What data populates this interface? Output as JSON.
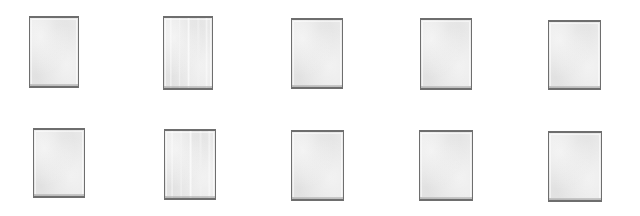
{
  "page": {
    "background_color": "#ffffff",
    "width": 640,
    "height": 216,
    "rows": 2,
    "columns": 5,
    "card_count": 10
  },
  "style": {
    "card_fill_color": "#e9e9e9",
    "card_border_color": "#6e6e6e",
    "card_border_width": 1,
    "card_top_bottom_border_width": 2
  },
  "cards": [
    {
      "id": "card-1",
      "row": 1,
      "column": 1,
      "label": "",
      "x": 29,
      "y": 16,
      "width": 50,
      "height": 72,
      "streaked": false
    },
    {
      "id": "card-2",
      "row": 1,
      "column": 2,
      "label": "",
      "x": 163,
      "y": 16,
      "width": 50,
      "height": 74,
      "streaked": true
    },
    {
      "id": "card-3",
      "row": 1,
      "column": 3,
      "label": "",
      "x": 291,
      "y": 18,
      "width": 52,
      "height": 71,
      "streaked": false
    },
    {
      "id": "card-4",
      "row": 1,
      "column": 4,
      "label": "",
      "x": 420,
      "y": 18,
      "width": 52,
      "height": 72,
      "streaked": false
    },
    {
      "id": "card-5",
      "row": 1,
      "column": 5,
      "label": "",
      "x": 548,
      "y": 20,
      "width": 53,
      "height": 70,
      "streaked": false
    },
    {
      "id": "card-6",
      "row": 2,
      "column": 1,
      "label": "",
      "x": 33,
      "y": 128,
      "width": 52,
      "height": 70,
      "streaked": false
    },
    {
      "id": "card-7",
      "row": 2,
      "column": 2,
      "label": "",
      "x": 164,
      "y": 129,
      "width": 52,
      "height": 71,
      "streaked": true
    },
    {
      "id": "card-8",
      "row": 2,
      "column": 3,
      "label": "",
      "x": 291,
      "y": 130,
      "width": 53,
      "height": 71,
      "streaked": false
    },
    {
      "id": "card-9",
      "row": 2,
      "column": 4,
      "label": "",
      "x": 419,
      "y": 130,
      "width": 54,
      "height": 71,
      "streaked": false
    },
    {
      "id": "card-10",
      "row": 2,
      "column": 5,
      "label": "",
      "x": 548,
      "y": 131,
      "width": 54,
      "height": 71,
      "streaked": false
    }
  ]
}
